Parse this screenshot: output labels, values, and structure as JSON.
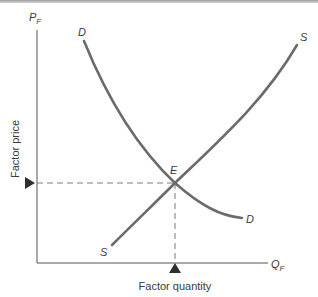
{
  "diagram": {
    "type": "factor-market-equilibrium",
    "y_axis": {
      "symbol": "P",
      "subscript": "F",
      "title": "Factor price"
    },
    "x_axis": {
      "symbol": "Q",
      "subscript": "F",
      "title": "Factor quantity"
    },
    "curves": [
      {
        "name": "demand",
        "label_start": "D",
        "label_end": "D"
      },
      {
        "name": "supply",
        "label_start": "S",
        "label_end": "S"
      }
    ],
    "equilibrium": {
      "label": "E"
    },
    "markers": {
      "price_marker": "triangle-right",
      "quantity_marker": "triangle-up"
    },
    "colors": {
      "axis": "#555555",
      "curve": "#6b6b6b",
      "dashed": "#7a7a7a",
      "marker": "#2e2e2e",
      "text": "#3a3a3a"
    }
  }
}
